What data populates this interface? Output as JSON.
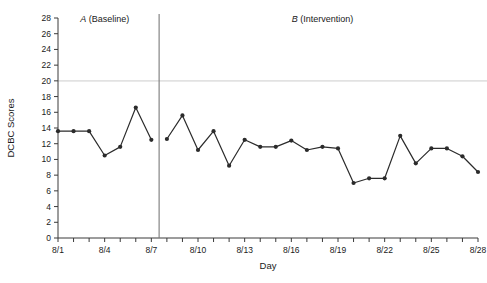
{
  "chart_data": {
    "type": "line",
    "title": "",
    "xlabel": "Day",
    "ylabel": "DCBC Scores",
    "ylim": [
      0,
      28
    ],
    "ytick_step": 2,
    "yticks": [
      0,
      2,
      4,
      6,
      8,
      10,
      12,
      14,
      16,
      18,
      20,
      22,
      24,
      26,
      28
    ],
    "grid": false,
    "legend": "none",
    "x": [
      "8/1",
      "8/2",
      "8/3",
      "8/4",
      "8/5",
      "8/6",
      "8/7",
      "8/8",
      "8/9",
      "8/10",
      "8/11",
      "8/12",
      "8/13",
      "8/14",
      "8/15",
      "8/16",
      "8/17",
      "8/18",
      "8/19",
      "8/20",
      "8/21",
      "8/22",
      "8/23",
      "8/24",
      "8/25",
      "8/26",
      "8/27",
      "8/28"
    ],
    "xtick_labels": [
      "8/1",
      "8/4",
      "8/7",
      "8/10",
      "8/13",
      "8/16",
      "8/19",
      "8/22",
      "8/25",
      "8/28"
    ],
    "xtick_label_every": 3,
    "series": [
      {
        "name": "DCBC Scores",
        "values": [
          13.6,
          13.6,
          13.6,
          10.5,
          11.6,
          16.6,
          12.5,
          12.6,
          15.6,
          11.2,
          13.6,
          9.2,
          12.5,
          11.6,
          11.6,
          12.4,
          11.2,
          11.6,
          11.4,
          7.0,
          7.6,
          7.6,
          13.0,
          9.5,
          11.4,
          11.4,
          10.4,
          8.4
        ]
      }
    ],
    "phases": [
      {
        "key": "A",
        "letter": "A",
        "label": "(Baseline)",
        "start_index": 0,
        "end_index": 6
      },
      {
        "key": "B",
        "letter": "B",
        "label": "(Intervention)",
        "start_index": 7,
        "end_index": 27
      }
    ],
    "phase_divider_after_index": 6,
    "colors": {
      "line": "#2b2b2b",
      "marker": "#2b2b2b",
      "axis": "#3a3a3a",
      "divider": "#7a7a7a",
      "background": "#ffffff"
    }
  }
}
